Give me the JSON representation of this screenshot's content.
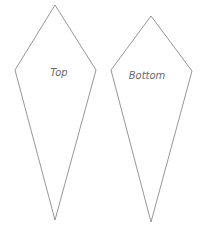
{
  "diagram": {
    "pieces": [
      {
        "label": "Top",
        "points": "55,5 96,70 55,220 15,70",
        "label_x": 59,
        "label_y": 76
      },
      {
        "label": "Bottom",
        "points": "151,16 192,71 151,222 111,70",
        "label_x": 147,
        "label_y": 79
      }
    ],
    "stroke_color": "#8a8a8a",
    "label_color": "#6a6a6a"
  }
}
